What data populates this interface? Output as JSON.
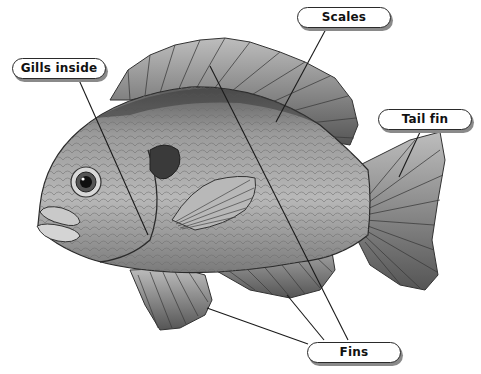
{
  "diagram": {
    "labels": [
      {
        "id": "gills",
        "text": "Gills inside"
      },
      {
        "id": "scales",
        "text": "Scales"
      },
      {
        "id": "tail",
        "text": "Tail fin"
      },
      {
        "id": "fins",
        "text": "Fins"
      }
    ]
  },
  "colors": {
    "background": "#ffffff",
    "label_border": "#2a2a2a",
    "label_shadow": "#8a8a8a",
    "leader_line": "#1a1a1a"
  }
}
